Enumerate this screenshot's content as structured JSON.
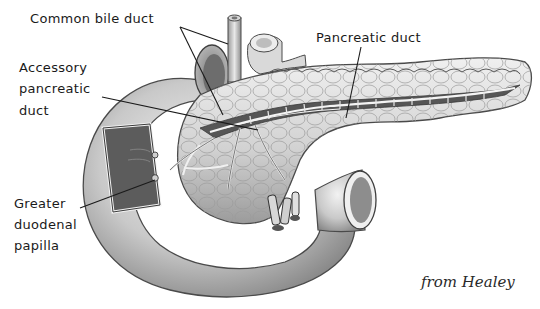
{
  "figure": {
    "credit": "from Healey",
    "colors": {
      "ink": "#1a1a1a",
      "tissue_light": "#e4e4e4",
      "tissue_mid": "#bdbdbd",
      "tissue_dark": "#6e6e6e",
      "background": "#ffffff"
    }
  },
  "labels": {
    "common_bile_duct": "Common bile duct",
    "pancreatic_duct": "Pancreatic duct",
    "accessory_pancreatic_duct": [
      "Accessory",
      "pancreatic",
      "duct"
    ],
    "greater_duodenal_papilla": [
      "Greater",
      "duodenal",
      "papilla"
    ]
  }
}
